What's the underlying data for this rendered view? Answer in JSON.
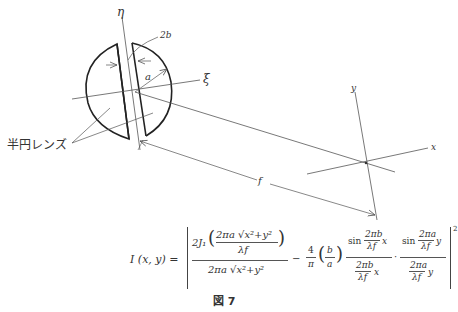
{
  "diagram": {
    "labels": {
      "eta_axis": "η",
      "xi_axis": "ξ",
      "gap_width": "2b",
      "radius": "a",
      "lens_label": "半円レンズ",
      "y_axis": "y",
      "x_axis": "x",
      "focal_length": "f"
    },
    "colors": {
      "lens_stroke": "#222222",
      "line_stroke": "#555555",
      "background": "#ffffff"
    }
  },
  "formula": {
    "lhs": "I (x, y) =",
    "term1_numerator": "2J₁(2πa √(x²+y²) / λf)",
    "term1_inner_numerator": "2πa √x²+y²",
    "term1_inner_denominator": "λf",
    "term1_prefix": "2J₁",
    "term1_denominator": "2πa √x²+y²",
    "minus": "−",
    "coef_numerator": "4",
    "coef_denominator": "π",
    "ratio_numerator": "b",
    "ratio_denominator": "a",
    "sinc1_num": "sin 2πb/λf x",
    "sinc1_num_sin": "sin",
    "sinc1_num_frac_top": "2πb",
    "sinc1_num_frac_bottom": "λf",
    "sinc1_num_var": "x",
    "sinc1_den_frac_top": "2πb",
    "sinc1_den_frac_bottom": "λf",
    "sinc1_den_var": "x",
    "dot": "·",
    "sinc2_num_sin": "sin",
    "sinc2_num_frac_top": "2πa",
    "sinc2_num_frac_bottom": "λf",
    "sinc2_num_var": "y",
    "sinc2_den_frac_top": "2πa",
    "sinc2_den_frac_bottom": "λf",
    "sinc2_den_var": "y",
    "exponent": "2"
  },
  "caption": "図 7"
}
